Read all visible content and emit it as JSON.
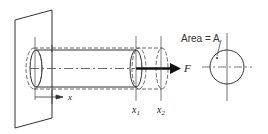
{
  "diagram": {
    "labels": {
      "force": "F",
      "axis": "x",
      "section1_main": "x",
      "section1_sub": "1",
      "section2_main": "x",
      "section2_sub": "2",
      "area": "Area = A"
    },
    "colors": {
      "line": "#333333",
      "arrow": "#111111",
      "background": "#ffffff"
    }
  }
}
